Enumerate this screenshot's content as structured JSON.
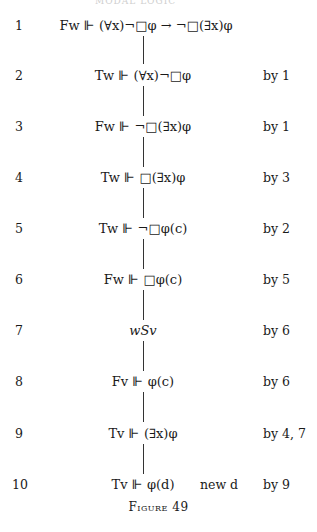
{
  "running_header": "MODAL LOGIC",
  "rows": [
    {
      "num": "1",
      "formula": "Fw ⊩ (∀x)¬□φ → ¬□(∃x)φ",
      "note": "",
      "justification": ""
    },
    {
      "num": "2",
      "formula": "Tw ⊩ (∀x)¬□φ",
      "note": "",
      "justification": "by 1"
    },
    {
      "num": "3",
      "formula": "Fw ⊩ ¬□(∃x)φ",
      "note": "",
      "justification": "by 1"
    },
    {
      "num": "4",
      "formula": "Tw ⊩ □(∃x)φ",
      "note": "",
      "justification": "by 3"
    },
    {
      "num": "5",
      "formula": "Tw ⊩ ¬□φ(c)",
      "note": "",
      "justification": "by 2"
    },
    {
      "num": "6",
      "formula": "Fw ⊩ □φ(c)",
      "note": "",
      "justification": "by 5"
    },
    {
      "num": "7",
      "formula": "wSv",
      "note": "",
      "justification": "by 6"
    },
    {
      "num": "8",
      "formula": "Fv ⊩ φ(c)",
      "note": "",
      "justification": "by 6"
    },
    {
      "num": "9",
      "formula": "Tv ⊩ (∃x)φ",
      "note": "",
      "justification": "by 4,  7"
    },
    {
      "num": "10",
      "formula": "Tv ⊩ φ(d)",
      "note": "new d",
      "justification": "by 9"
    }
  ],
  "caption": "Figure 49"
}
